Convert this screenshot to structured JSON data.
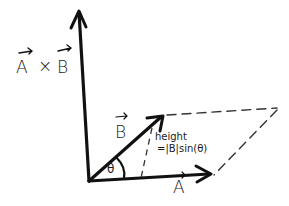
{
  "diagram": {
    "type": "cross-product-geometry",
    "labels": {
      "cross_product": {
        "left": "A",
        "op": "×",
        "right": "B"
      },
      "vector_a": "A",
      "vector_b": "B",
      "angle": "θ",
      "height_line1": "height",
      "height_line2": "=|B|sin(θ)"
    },
    "colors": {
      "stroke": "#111111",
      "dashed": "#333333",
      "background": "#ffffff"
    }
  }
}
